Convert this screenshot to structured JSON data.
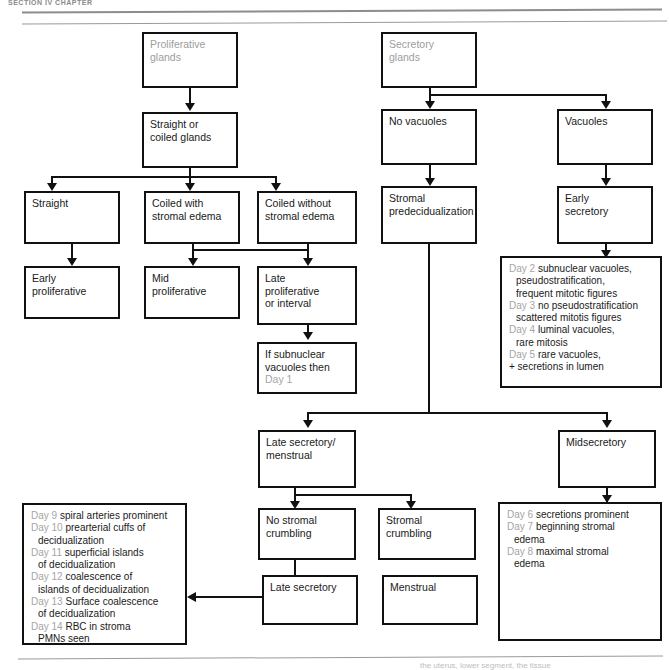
{
  "page": {
    "header_text": "SECTION IV    CHAPTER",
    "footer_text": "the uterus, lower segment, the tissue"
  },
  "boxes": {
    "proliferative_glands": {
      "lines": [
        "Proliferative",
        "glands"
      ]
    },
    "straight_or_coiled_glands": {
      "lines": [
        "Straight or",
        "coiled glands"
      ]
    },
    "straight": {
      "lines": [
        "Straight"
      ]
    },
    "coiled_with_stromal_edema": {
      "lines": [
        "Coiled with",
        "stromal edema"
      ]
    },
    "coiled_without_stromal_edema": {
      "lines": [
        "Coiled without",
        "stromal edema"
      ]
    },
    "early_proliferative": {
      "lines": [
        "Early",
        "proliferative"
      ]
    },
    "mid_proliferative": {
      "lines": [
        "Mid",
        "proliferative"
      ]
    },
    "late_proliferative": {
      "lines": [
        "Late",
        "proliferative",
        "or interval"
      ]
    },
    "if_subnuclear_vacuoles": {
      "lines": [
        "If subnuclear",
        "vacuoles then"
      ],
      "gray_line": "Day 1"
    },
    "secretory_glands": {
      "lines": [
        "Secretory",
        "glands"
      ]
    },
    "no_vacuoles": {
      "lines": [
        "No vacuoles"
      ]
    },
    "vacuoles": {
      "lines": [
        "Vacuoles"
      ]
    },
    "stromal_predecidualization": {
      "lines": [
        "Stromal",
        "predecidualization"
      ]
    },
    "early_secretory": {
      "lines": [
        "Early",
        "secretory"
      ]
    },
    "late_secretory_menstrual": {
      "lines": [
        "Late secretory/",
        "menstrual"
      ]
    },
    "midsecretory": {
      "lines": [
        "Midsecretory"
      ]
    },
    "no_stromal_crumbling": {
      "lines": [
        "No stromal",
        "crumbling"
      ]
    },
    "stromal_crumbling": {
      "lines": [
        "Stromal crumbling"
      ]
    },
    "late_secretory": {
      "lines": [
        "Late secretory"
      ]
    },
    "menstrual": {
      "lines": [
        "Menstrual"
      ]
    }
  },
  "day_lists": {
    "early_secretory_days": {
      "entries": [
        {
          "day": "Day 2",
          "text": "subnuclear vacuoles,",
          "cont": [
            "pseudostratification,",
            "frequent mitotic figures"
          ]
        },
        {
          "day": "Day 3",
          "text": "no pseudostratification",
          "cont": [
            "scattered mitotis figures"
          ]
        },
        {
          "day": "Day 4",
          "text": "luminal vacuoles,",
          "cont": [
            "rare mitosis"
          ]
        },
        {
          "day": "Day 5",
          "text": "rare vacuoles,",
          "cont": []
        }
      ],
      "trailer": "+ secretions in lumen"
    },
    "midsecretory_days": {
      "entries": [
        {
          "day": "Day 6",
          "text": "secretions prominent",
          "cont": []
        },
        {
          "day": "Day 7",
          "text": "beginning stromal",
          "cont": [
            "edema"
          ]
        },
        {
          "day": "Day 8",
          "text": "maximal stromal",
          "cont": [
            "edema"
          ]
        }
      ],
      "trailer": ""
    },
    "menstrual_days": {
      "entries": [
        {
          "day": "Day 9",
          "text": "spiral arteries prominent",
          "cont": []
        },
        {
          "day": "Day 10",
          "text": "prearterial cuffs of",
          "cont": [
            "decidualization"
          ]
        },
        {
          "day": "Day 11",
          "text": "superficial islands",
          "cont": [
            "of decidualization"
          ]
        },
        {
          "day": "Day 12",
          "text": "coalescence of",
          "cont": [
            "islands of decidualization"
          ]
        },
        {
          "day": "Day 13",
          "text": "Surface coalescence",
          "cont": [
            "of decidualization"
          ]
        },
        {
          "day": "Day 14",
          "text": "RBC in stroma",
          "cont": [
            "PMNs seen"
          ]
        }
      ],
      "trailer": ""
    }
  },
  "colors": {
    "stroke": "#111111",
    "gray_text": "#9d9d9d",
    "rule": "#9a9a9a"
  }
}
